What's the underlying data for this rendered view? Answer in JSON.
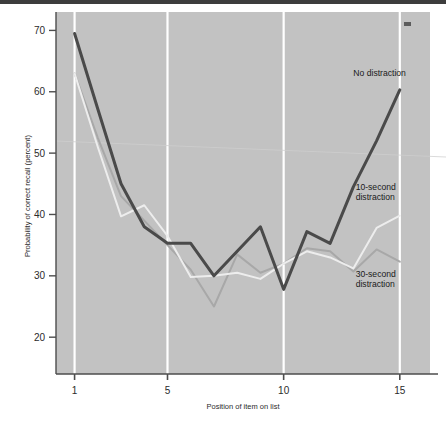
{
  "chart_data": {
    "type": "line",
    "title": "",
    "xlabel": "Position of item on list",
    "ylabel": "Probability of correct recall (percent)",
    "xlim": [
      0.2,
      16.3
    ],
    "ylim": [
      14,
      73
    ],
    "xticks": [
      1,
      5,
      10,
      15
    ],
    "xticklabels": [
      "1",
      "5",
      "10",
      "15"
    ],
    "yticks": [
      20,
      30,
      40,
      50,
      60,
      70
    ],
    "yticklabels": [
      "20",
      "30",
      "40",
      "50",
      "60",
      "70"
    ],
    "grid": "vertical-white-gridlines-at-xticks",
    "legend_position": "inline-annotations-right",
    "plot_background": "#c2c2c2",
    "x": [
      1,
      2,
      3,
      4,
      5,
      6,
      7,
      8,
      9,
      10,
      11,
      12,
      13,
      14,
      15
    ],
    "series": [
      {
        "name": "No distraction",
        "color": "#4a4a4a",
        "linewidth": 3.0,
        "values": [
          69.5,
          57.2,
          45.0,
          38.0,
          35.3,
          35.3,
          30.0,
          34.0,
          38.0,
          27.8,
          37.2,
          35.3,
          44.5,
          52.0,
          60.3
        ],
        "label_x": 13.0,
        "label_y": 62.5
      },
      {
        "name": "10-second distraction",
        "color": "#ededed",
        "linewidth": 2.0,
        "values": [
          63.0,
          51.0,
          39.7,
          41.5,
          36.5,
          29.8,
          30.0,
          30.5,
          29.5,
          32.0,
          34.0,
          33.0,
          31.2,
          37.8,
          39.8
        ],
        "label_x": 13.1,
        "label_y": 44.0
      },
      {
        "name": "30-second distraction",
        "color": "#a8a8a8",
        "linewidth": 2.0,
        "values": [
          63.0,
          52.5,
          43.0,
          39.0,
          35.0,
          31.0,
          25.0,
          33.5,
          30.5,
          32.0,
          34.5,
          34.0,
          30.7,
          34.3,
          32.3
        ],
        "label_x": 13.1,
        "label_y": 29.8
      }
    ]
  },
  "annotations": {
    "series_labels": [
      {
        "text": "No distraction"
      },
      {
        "text_line1": "10-second",
        "text_line2": "distraction"
      },
      {
        "text_line1": "30-second",
        "text_line2": "distraction"
      }
    ],
    "corner_mark": "•"
  },
  "axis": {
    "x_title": "Position of item on list",
    "y_title": "Probability of correct recall (percent)"
  }
}
